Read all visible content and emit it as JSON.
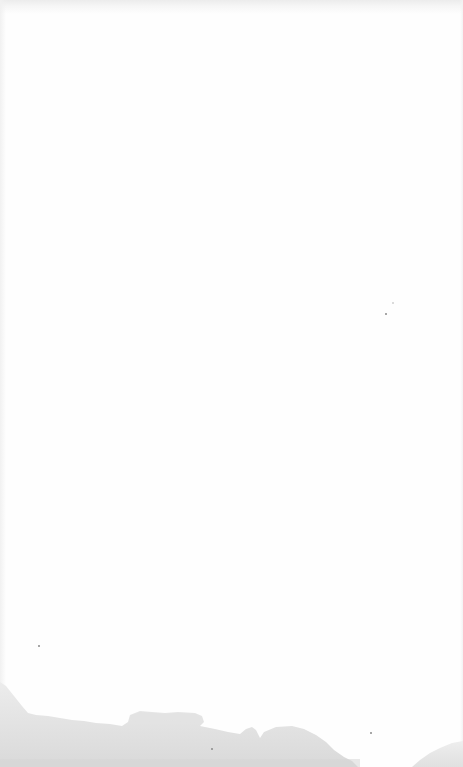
{
  "image": {
    "description": "Overexposed, nearly white photograph with a faint gray landscape silhouette along the bottom edge",
    "background_color": "#fefefe",
    "top_band_color": "#ececec",
    "landscape_colors": {
      "far_hills": "#e9e9e9",
      "near_ground": "#dedede",
      "right_mound": "#e4e4e4"
    },
    "specks": [
      {
        "x": 385,
        "y": 313,
        "size": 2
      },
      {
        "x": 392,
        "y": 302,
        "size": 2
      },
      {
        "x": 38,
        "y": 645,
        "size": 2
      },
      {
        "x": 211,
        "y": 748,
        "size": 2
      },
      {
        "x": 370,
        "y": 732,
        "size": 2
      }
    ]
  }
}
